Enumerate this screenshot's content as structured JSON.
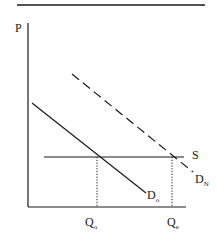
{
  "diagram": {
    "type": "supply-demand",
    "axes": {
      "y_label": "P",
      "x_ticks": [
        {
          "main": "Q",
          "sub": "o"
        },
        {
          "main": "Q",
          "sub": "e"
        }
      ]
    },
    "curves": [
      {
        "name": "D",
        "sub": "o",
        "style": "solid",
        "role": "original demand"
      },
      {
        "name": "D",
        "sub": "N",
        "style": "dashed",
        "role": "new demand"
      },
      {
        "name": "S",
        "sub": "",
        "style": "solid",
        "role": "supply (horizontal)"
      }
    ],
    "colors": {
      "line": "#1a1a1a",
      "background": "#ffffff"
    }
  }
}
